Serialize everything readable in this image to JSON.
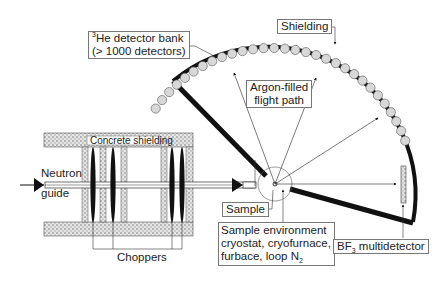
{
  "diagram": {
    "labels": {
      "he_bank_line1_sup": "3",
      "he_bank_line1": "He detector bank",
      "he_bank_line2": "(> 1000 detectors)",
      "shielding": "Shielding",
      "argon_line1": "Argon-filled",
      "argon_line2": "flight path",
      "concrete": "Concrete shielding",
      "neutron": "Neutron",
      "guide": "guide",
      "choppers": "Choppers",
      "sample": "Sample",
      "env_line1": "Sample environment",
      "env_line2": "cryostat,  cryofurnace,",
      "env_line3_pre": "furbace, loop N",
      "env_line3_sub": "2",
      "bf3_pre": "BF",
      "bf3_sub": "3",
      "bf3_post": " multidetector"
    },
    "components": [
      "neutron guide",
      "concrete shielding",
      "choppers (4)",
      "sample",
      "sample environment",
      "argon-filled flight path",
      "3He detector bank",
      "shielding",
      "BF3 multidetector"
    ],
    "colors": {
      "line": "#111111",
      "box_border": "#777777",
      "detector_fill": "#d8d8d8",
      "concrete_fill": "#bdbdbd"
    }
  }
}
